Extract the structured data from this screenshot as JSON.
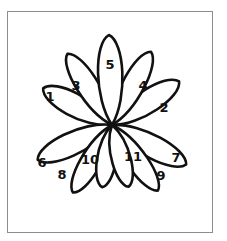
{
  "figure": {
    "kind": "hand-drawn-line-diagram",
    "background_color": "#ffffff",
    "ink_color": "#111111",
    "frame": {
      "name": "figure-border",
      "color": "#8d8d8d",
      "x": 7,
      "y": 11,
      "width": 206,
      "height": 222
    },
    "center": {
      "x": 112,
      "y": 125
    },
    "petal_count": 11
  },
  "chart_data": {
    "type": "scatter",
    "title": "",
    "xlabel": "",
    "ylabel": "",
    "categories": [
      "1",
      "2",
      "3",
      "4",
      "5",
      "6",
      "7",
      "8",
      "9",
      "10",
      "11"
    ],
    "series": [
      {
        "name": "petals",
        "values": [
          1,
          2,
          3,
          4,
          5,
          6,
          7,
          8,
          9,
          10,
          11
        ]
      }
    ],
    "petals": [
      {
        "label": "1",
        "angle_deg": 152,
        "length": 78,
        "half_width": 17,
        "label_x": 50,
        "label_y": 97
      },
      {
        "label": "2",
        "angle_deg": 33,
        "length": 80,
        "half_width": 17,
        "label_x": 164,
        "label_y": 108
      },
      {
        "label": "3",
        "angle_deg": 122,
        "length": 84,
        "half_width": 16,
        "label_x": 76,
        "label_y": 86
      },
      {
        "label": "4",
        "angle_deg": 62,
        "length": 83,
        "half_width": 16,
        "label_x": 143,
        "label_y": 86
      },
      {
        "label": "5",
        "angle_deg": 92,
        "length": 90,
        "half_width": 18,
        "label_x": 110,
        "label_y": 65
      },
      {
        "label": "6",
        "angle_deg": 205,
        "length": 82,
        "half_width": 17,
        "label_x": 42,
        "label_y": 163
      },
      {
        "label": "7",
        "angle_deg": 332,
        "length": 84,
        "half_width": 17,
        "label_x": 176,
        "label_y": 158
      },
      {
        "label": "8",
        "angle_deg": 240,
        "length": 78,
        "half_width": 15,
        "label_x": 62,
        "label_y": 175
      },
      {
        "label": "9",
        "angle_deg": 305,
        "length": 80,
        "half_width": 15,
        "label_x": 161,
        "label_y": 176
      },
      {
        "label": "10",
        "angle_deg": 261,
        "length": 63,
        "half_width": 14,
        "label_x": 90,
        "label_y": 160
      },
      {
        "label": "11",
        "angle_deg": 285,
        "length": 64,
        "half_width": 14,
        "label_x": 133,
        "label_y": 157
      }
    ]
  }
}
